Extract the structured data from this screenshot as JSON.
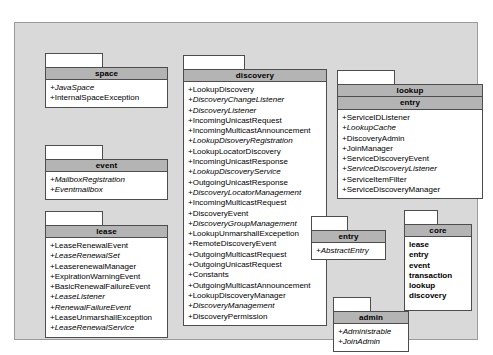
{
  "diagram": {
    "kind": "uml-package-diagram",
    "background_color": "#d9d9d9",
    "package_header_color": "#b4b4b4",
    "package_body_color": "#ffffff",
    "border_color": "#4d4d4d"
  },
  "packages": {
    "space": {
      "title": "space",
      "members": [
        {
          "text": "+JavaSpace",
          "style": "italic"
        },
        {
          "text": "+InternalSpaceException",
          "style": "regular"
        }
      ]
    },
    "event": {
      "title": "event",
      "members": [
        {
          "text": "+MailboxRegistration",
          "style": "italic"
        },
        {
          "text": "+Eventmailbox",
          "style": "italic"
        }
      ]
    },
    "lease": {
      "title": "lease",
      "members": [
        {
          "text": "+LeaseRenewalEvent",
          "style": "regular"
        },
        {
          "text": "+LeaseRenewalSet",
          "style": "italic"
        },
        {
          "text": "+LeaserenewalManager",
          "style": "regular"
        },
        {
          "text": "+ExpirationWarningEvent",
          "style": "regular"
        },
        {
          "text": "+BasicRenewalFailureEvent",
          "style": "regular"
        },
        {
          "text": "+LeaseListener",
          "style": "italic"
        },
        {
          "text": "+RenewalFailureEvent",
          "style": "italic"
        },
        {
          "text": "+LeaseUnmarshallException",
          "style": "regular"
        },
        {
          "text": "+LeaseRenewalService",
          "style": "italic"
        }
      ]
    },
    "discovery": {
      "title": "discovery",
      "members": [
        {
          "text": "+LookupDiscovery",
          "style": "regular"
        },
        {
          "text": "+DiscoveryChangeListener",
          "style": "italic"
        },
        {
          "text": "+DiscoveryListener",
          "style": "italic"
        },
        {
          "text": "+IncomingUnicastRequest",
          "style": "regular"
        },
        {
          "text": "+IncomingMulticastAnnouncement",
          "style": "regular"
        },
        {
          "text": "+LookupDisoveryRegistration",
          "style": "italic"
        },
        {
          "text": "+LookupLocatorDiscovery",
          "style": "regular"
        },
        {
          "text": "+IncomingUnicastResponse",
          "style": "regular"
        },
        {
          "text": "+LookupDiscoveryService",
          "style": "italic"
        },
        {
          "text": "+OutgoingUnicastResponse",
          "style": "regular"
        },
        {
          "text": "+DiscoveryLocatorManagement",
          "style": "italic"
        },
        {
          "text": "+IncomingMulticastRequest",
          "style": "regular"
        },
        {
          "text": "+DiscoveryEvent",
          "style": "regular"
        },
        {
          "text": "+DiscoveryGroupManagement",
          "style": "italic"
        },
        {
          "text": "+LookupUnmarshallExcepetion",
          "style": "regular"
        },
        {
          "text": "+RemoteDiscoveryEvent",
          "style": "regular"
        },
        {
          "text": "+OutgoingMulticastRequest",
          "style": "regular"
        },
        {
          "text": "+OutgoingUnicastRequest",
          "style": "regular"
        },
        {
          "text": "+Constants",
          "style": "regular"
        },
        {
          "text": "+OutgoingMulticastAnnouncement",
          "style": "regular"
        },
        {
          "text": "+LookupDiscoveryManager",
          "style": "regular"
        },
        {
          "text": "+DiscoveryManagement",
          "style": "italic"
        },
        {
          "text": "+DiscoveryPermission",
          "style": "regular"
        }
      ]
    },
    "lookup": {
      "title": "lookup",
      "subtitle": "entry",
      "members": [
        {
          "text": "+ServiceIDListener",
          "style": "regular"
        },
        {
          "text": "+LookupCache",
          "style": "italic"
        },
        {
          "text": "+DiscoveryAdmin",
          "style": "regular"
        },
        {
          "text": "+JoinManager",
          "style": "regular"
        },
        {
          "text": "+ServiceDiscoveryEvent",
          "style": "regular"
        },
        {
          "text": "+ServiceDiscoveryListener",
          "style": "italic"
        },
        {
          "text": "+ServiceItemFilter",
          "style": "regular"
        },
        {
          "text": "+ServiceDiscoveryManager",
          "style": "regular"
        }
      ]
    },
    "entry": {
      "title": "entry",
      "members": [
        {
          "text": "+AbstractEntry",
          "style": "italic"
        }
      ]
    },
    "core": {
      "title": "core",
      "members": [
        {
          "text": "lease",
          "style": "bold"
        },
        {
          "text": "entry",
          "style": "bold"
        },
        {
          "text": "event",
          "style": "bold"
        },
        {
          "text": "transaction",
          "style": "bold"
        },
        {
          "text": "lookup",
          "style": "bold"
        },
        {
          "text": "discovery",
          "style": "bold"
        }
      ]
    },
    "admin": {
      "title": "admin",
      "members": [
        {
          "text": "+Administrable",
          "style": "italic"
        },
        {
          "text": "+JoinAdmin",
          "style": "italic"
        }
      ]
    }
  }
}
